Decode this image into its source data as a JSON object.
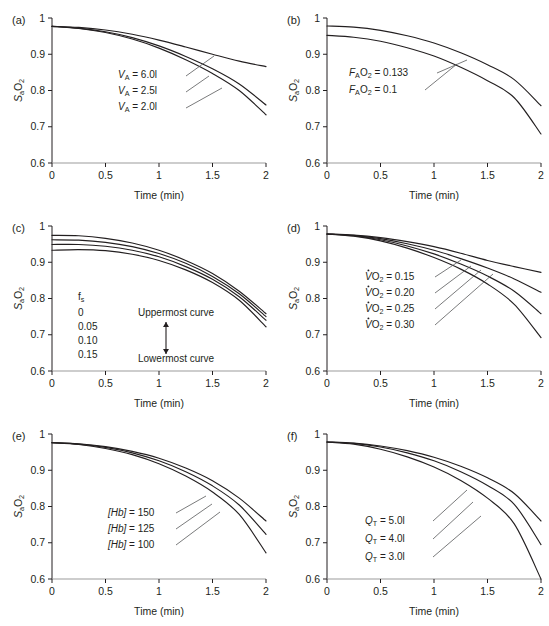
{
  "figure": {
    "caption_label": "",
    "axes": {
      "xlabel": "Time (min)",
      "ylabel_main": "S",
      "ylabel_sub": "a",
      "ylabel_o": "O",
      "ylabel_o_sub": "2",
      "xticks": [
        "0",
        "0.5",
        "1",
        "1.5",
        "2"
      ],
      "yticks": [
        "0.6",
        "0.7",
        "0.8",
        "0.9",
        "1"
      ],
      "xlim": [
        0,
        2
      ],
      "ylim": [
        0.6,
        1.0
      ]
    }
  },
  "chart_data": [
    {
      "type": "line",
      "panel": "(a)",
      "title": "",
      "xlabel": "Time (min)",
      "ylabel": "SaO2",
      "xlim": [
        0,
        2
      ],
      "ylim": [
        0.6,
        1.0
      ],
      "grid": false,
      "x": [
        0,
        0.25,
        0.5,
        0.75,
        1.0,
        1.25,
        1.5,
        1.75,
        2.0
      ],
      "series": [
        {
          "name": "VA = 6.0l",
          "values": [
            0.977,
            0.974,
            0.967,
            0.955,
            0.939,
            0.92,
            0.9,
            0.881,
            0.866
          ]
        },
        {
          "name": "VA = 2.5l",
          "values": [
            0.977,
            0.972,
            0.962,
            0.946,
            0.923,
            0.894,
            0.86,
            0.818,
            0.76
          ]
        },
        {
          "name": "VA = 2.0l",
          "values": [
            0.977,
            0.971,
            0.96,
            0.942,
            0.917,
            0.885,
            0.847,
            0.8,
            0.733
          ]
        }
      ],
      "annotations": [
        {
          "var": "V",
          "sub": "A",
          "dot": false,
          "text": " = 6.0l"
        },
        {
          "var": "V",
          "sub": "A",
          "dot": false,
          "text": " = 2.5l"
        },
        {
          "var": "V",
          "sub": "A",
          "dot": false,
          "text": " = 2.0l"
        }
      ]
    },
    {
      "type": "line",
      "panel": "(b)",
      "title": "",
      "xlabel": "Time (min)",
      "ylabel": "SaO2",
      "xlim": [
        0,
        2
      ],
      "ylim": [
        0.6,
        1.0
      ],
      "grid": false,
      "x": [
        0,
        0.25,
        0.5,
        0.75,
        1.0,
        1.25,
        1.5,
        1.75,
        2.0
      ],
      "series": [
        {
          "name": "FAO2 = 0.133",
          "values": [
            0.978,
            0.975,
            0.966,
            0.951,
            0.931,
            0.904,
            0.871,
            0.83,
            0.758
          ]
        },
        {
          "name": "FAO2 = 0.1",
          "values": [
            0.952,
            0.947,
            0.936,
            0.918,
            0.895,
            0.864,
            0.827,
            0.78,
            0.68
          ]
        }
      ],
      "annotations": [
        {
          "var": "F",
          "sub": "A",
          "dot": false,
          "text": "O",
          "sup": "2",
          "value": " = 0.133"
        },
        {
          "var": "F",
          "sub": "A",
          "dot": false,
          "text": "O",
          "sup": "2",
          "value": " = 0.1"
        }
      ]
    },
    {
      "type": "line",
      "panel": "(c)",
      "title": "",
      "xlabel": "Time (min)",
      "ylabel": "SaO2",
      "xlim": [
        0,
        2
      ],
      "ylim": [
        0.6,
        1.0
      ],
      "grid": false,
      "legend_header": "f",
      "legend_header_sub": "s",
      "legend_values": [
        "0",
        "0.05",
        "0.10",
        "0.15"
      ],
      "legend_top_note": "Uppermost curve",
      "legend_bottom_note": "Lowermost curve",
      "x": [
        0,
        0.25,
        0.5,
        0.75,
        1.0,
        1.25,
        1.5,
        1.75,
        2.0
      ],
      "series": [
        {
          "name": "fs = 0",
          "values": [
            0.974,
            0.973,
            0.966,
            0.953,
            0.933,
            0.905,
            0.869,
            0.82,
            0.758
          ]
        },
        {
          "name": "fs = 0.05",
          "values": [
            0.962,
            0.961,
            0.955,
            0.943,
            0.924,
            0.897,
            0.861,
            0.813,
            0.75
          ]
        },
        {
          "name": "fs = 0.10",
          "values": [
            0.949,
            0.949,
            0.944,
            0.933,
            0.915,
            0.888,
            0.853,
            0.805,
            0.74
          ]
        },
        {
          "name": "fs = 0.15",
          "values": [
            0.933,
            0.935,
            0.932,
            0.922,
            0.905,
            0.879,
            0.844,
            0.795,
            0.722
          ]
        }
      ]
    },
    {
      "type": "line",
      "panel": "(d)",
      "title": "",
      "xlabel": "Time (min)",
      "ylabel": "SaO2",
      "xlim": [
        0,
        2
      ],
      "ylim": [
        0.6,
        1.0
      ],
      "grid": false,
      "x": [
        0,
        0.25,
        0.5,
        0.75,
        1.0,
        1.25,
        1.5,
        1.75,
        2.0
      ],
      "series": [
        {
          "name": "VO2 = 0.15",
          "values": [
            0.978,
            0.975,
            0.968,
            0.957,
            0.943,
            0.925,
            0.905,
            0.888,
            0.872
          ]
        },
        {
          "name": "VO2 = 0.20",
          "values": [
            0.978,
            0.974,
            0.965,
            0.951,
            0.933,
            0.91,
            0.884,
            0.854,
            0.817
          ]
        },
        {
          "name": "VO2 = 0.25",
          "values": [
            0.978,
            0.973,
            0.962,
            0.945,
            0.923,
            0.895,
            0.862,
            0.82,
            0.758
          ]
        },
        {
          "name": "VO2 = 0.30",
          "values": [
            0.978,
            0.972,
            0.959,
            0.939,
            0.913,
            0.881,
            0.84,
            0.784,
            0.692
          ]
        }
      ],
      "annotations": [
        {
          "var": "V",
          "sub": "",
          "dot": true,
          "text": "O",
          "sup": "2",
          "value": " = 0.15"
        },
        {
          "var": "V",
          "sub": "",
          "dot": true,
          "text": "O",
          "sup": "2",
          "value": " = 0.20"
        },
        {
          "var": "V",
          "sub": "",
          "dot": true,
          "text": "O",
          "sup": "2",
          "value": " = 0.25"
        },
        {
          "var": "V",
          "sub": "",
          "dot": true,
          "text": "O",
          "sup": "2",
          "value": " = 0.30"
        }
      ]
    },
    {
      "type": "line",
      "panel": "(e)",
      "title": "",
      "xlabel": "Time (min)",
      "ylabel": "SaO2",
      "xlim": [
        0,
        2
      ],
      "ylim": [
        0.6,
        1.0
      ],
      "grid": false,
      "x": [
        0,
        0.25,
        0.5,
        0.75,
        1.0,
        1.25,
        1.5,
        1.75,
        2.0
      ],
      "series": [
        {
          "name": "[Hb] = 150",
          "values": [
            0.976,
            0.973,
            0.965,
            0.952,
            0.933,
            0.906,
            0.871,
            0.823,
            0.76
          ]
        },
        {
          "name": "[Hb] = 125",
          "values": [
            0.976,
            0.972,
            0.963,
            0.948,
            0.926,
            0.896,
            0.857,
            0.804,
            0.723
          ]
        },
        {
          "name": "[Hb] = 100",
          "values": [
            0.976,
            0.971,
            0.96,
            0.943,
            0.918,
            0.884,
            0.84,
            0.778,
            0.672
          ]
        }
      ],
      "annotations": [
        {
          "var": "[Hb]",
          "sub": "",
          "dot": false,
          "text": " = 150"
        },
        {
          "var": "[Hb]",
          "sub": "",
          "dot": false,
          "text": " = 125"
        },
        {
          "var": "[Hb]",
          "sub": "",
          "dot": false,
          "text": " = 100"
        }
      ]
    },
    {
      "type": "line",
      "panel": "(f)",
      "title": "",
      "xlabel": "Time (min)",
      "ylabel": "SaO2",
      "xlim": [
        0,
        2
      ],
      "ylim": [
        0.6,
        1.0
      ],
      "grid": false,
      "x": [
        0,
        0.25,
        0.5,
        0.75,
        1.0,
        1.25,
        1.5,
        1.75,
        2.0
      ],
      "series": [
        {
          "name": "QT = 5.0l",
          "values": [
            0.978,
            0.975,
            0.967,
            0.954,
            0.936,
            0.911,
            0.879,
            0.836,
            0.76
          ]
        },
        {
          "name": "QT = 4.0l",
          "values": [
            0.978,
            0.974,
            0.964,
            0.948,
            0.926,
            0.896,
            0.858,
            0.806,
            0.695
          ]
        },
        {
          "name": "QT = 3.0l",
          "values": [
            0.978,
            0.972,
            0.958,
            0.937,
            0.909,
            0.872,
            0.823,
            0.752,
            0.6
          ]
        }
      ],
      "annotations": [
        {
          "var": "Q",
          "sub": "T",
          "dot": false,
          "text": " = 5.0l"
        },
        {
          "var": "Q",
          "sub": "T",
          "dot": false,
          "text": " = 4.0l"
        },
        {
          "var": "Q",
          "sub": "T",
          "dot": false,
          "text": " = 3.0l"
        }
      ]
    }
  ]
}
